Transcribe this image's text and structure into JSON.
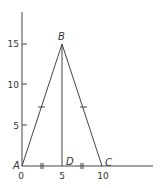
{
  "diagram": {
    "type": "isosceles-triangle-on-axes",
    "points": {
      "A": {
        "label": "A",
        "x": 0,
        "y": 0
      },
      "B": {
        "label": "B",
        "x": 5,
        "y": 15
      },
      "C": {
        "label": "C",
        "x": 10,
        "y": 0
      },
      "D": {
        "label": "D",
        "x": 5,
        "y": 0
      }
    },
    "x_ticks": [
      "0",
      "5",
      "10"
    ],
    "y_ticks": [
      "5",
      "10",
      "15"
    ],
    "segments": [
      "AB",
      "BC",
      "BD",
      "AC"
    ],
    "equal_marks": {
      "single": [
        "AB",
        "BC"
      ],
      "double": [
        "AD",
        "DC"
      ]
    },
    "line_color": "#444444"
  }
}
